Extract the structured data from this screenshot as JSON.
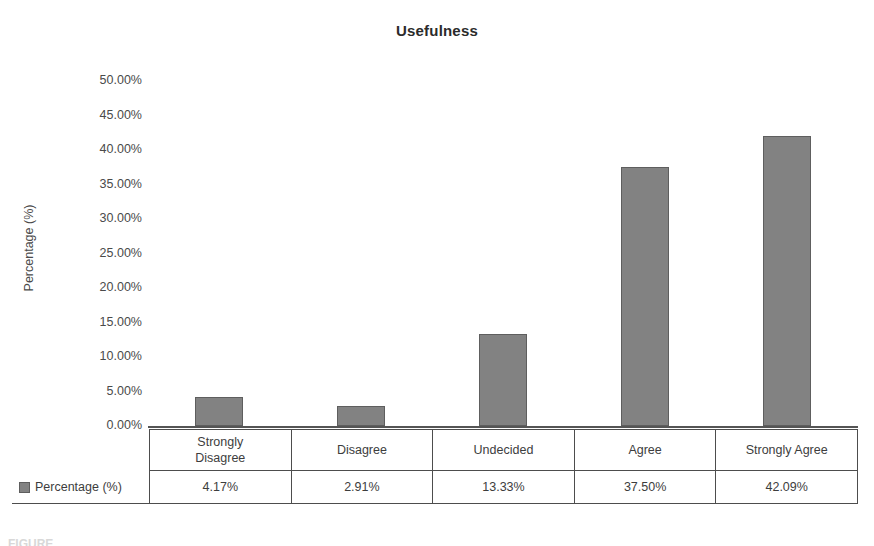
{
  "chart_data": {
    "type": "bar",
    "title": "Usefulness",
    "xlabel": "",
    "ylabel": "Percentage (%)",
    "categories": [
      "Strongly Disagree",
      "Disagree",
      "Undecided",
      "Agree",
      "Strongly Agree"
    ],
    "category_lines": [
      [
        "Strongly",
        "Disagree"
      ],
      [
        "Disagree"
      ],
      [
        "Undecided"
      ],
      [
        "Agree"
      ],
      [
        "Strongly Agree"
      ]
    ],
    "values": [
      4.17,
      2.91,
      13.33,
      37.5,
      42.09
    ],
    "value_labels": [
      "4.17%",
      "2.91%",
      "13.33%",
      "37.50%",
      "42.09%"
    ],
    "series_name": "Percentage (%)",
    "ylim": [
      0,
      50
    ],
    "ytick_step": 5,
    "ytick_labels": [
      "50.00%",
      "45.00%",
      "40.00%",
      "35.00%",
      "30.00%",
      "25.00%",
      "20.00%",
      "15.00%",
      "10.00%",
      "5.00%",
      "0.00%"
    ],
    "ytick_values": [
      50,
      45,
      40,
      35,
      30,
      25,
      20,
      15,
      10,
      5,
      0
    ],
    "grid": false,
    "legend_position": "data-table",
    "bar_color": "#828282",
    "bar_border_color": "#5e5e5e",
    "axis_color": "#555555",
    "text_color": "#3d3d3d"
  },
  "table": {
    "legend_label": "Percentage (%)"
  },
  "caption": {
    "remnant": "FIGURE"
  }
}
